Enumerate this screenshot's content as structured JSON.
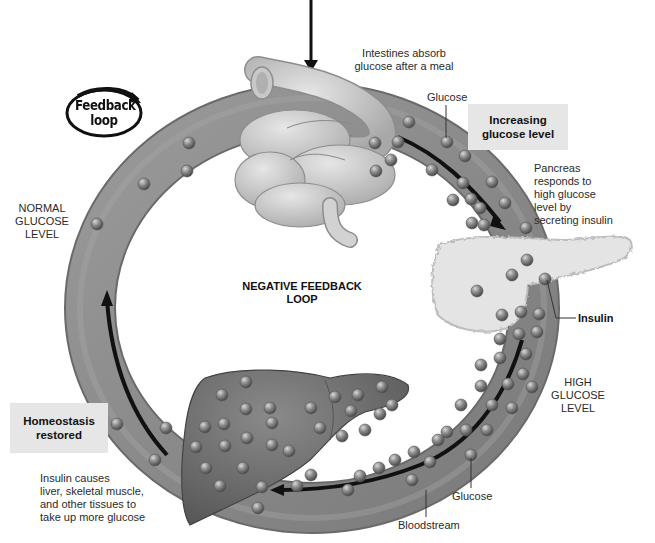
{
  "diagram": {
    "type": "negative-feedback-loop",
    "center_title": [
      "NEGATIVE FEEDBACK",
      "LOOP"
    ],
    "badge": [
      "Feedback",
      "loop"
    ],
    "labels": {
      "intestines": [
        "Intestines absorb",
        "glucose after a meal"
      ],
      "glucose_top": "Glucose",
      "pancreas": [
        "Pancreas",
        "responds to",
        "high glucose",
        "level by",
        "secreting insulin"
      ],
      "insulin": "Insulin",
      "high_level": [
        "HIGH",
        "GLUCOSE",
        "LEVEL"
      ],
      "normal_level": [
        "NORMAL",
        "GLUCOSE",
        "LEVEL"
      ],
      "glucose_bottom": "Glucose",
      "bloodstream": "Bloodstream",
      "insulin_effect": [
        "Insulin causes",
        "liver, skeletal muscle,",
        "and other tissues to",
        "take up more glucose"
      ]
    },
    "boxes": {
      "increasing": [
        "Increasing",
        "glucose level"
      ],
      "homeostasis": [
        "Homeostasis",
        "restored"
      ]
    },
    "organs": [
      "intestines",
      "pancreas",
      "liver"
    ],
    "flow": [
      "Intestines absorb glucose",
      "Increasing glucose level",
      "Pancreas secretes insulin",
      "High glucose level",
      "Liver/muscle take up glucose",
      "Homeostasis restored",
      "Normal glucose level"
    ],
    "colors": {
      "tube": "#8a8a8a",
      "tube_light": "#a9a9a9",
      "tube_dark": "#6a6a6a",
      "liver": "#6e6e6e",
      "intestine": "#cfcfcf",
      "pancreas": "#e4e4e4",
      "arrow": "#111111",
      "box": "#e6e6e6"
    }
  }
}
